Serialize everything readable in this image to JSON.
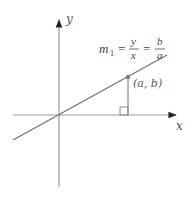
{
  "diagram": {
    "axes": {
      "x_label": "x",
      "y_label": "y"
    },
    "point": {
      "label": "(a, b)"
    },
    "equation": {
      "lhs": "m",
      "lhs_sub": "1",
      "eq1": "=",
      "frac1_num": "y",
      "frac1_den": "x",
      "eq2": "=",
      "frac2_num": "b",
      "frac2_den": "a"
    },
    "colors": {
      "axes": "#9a9a9a",
      "line": "#6e6e6e",
      "point": "#7a7a7a",
      "text": "#444444"
    }
  }
}
